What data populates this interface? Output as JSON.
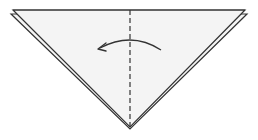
{
  "diagram": {
    "type": "origami-fold-step",
    "description": "Triangle (folded square) with vertical valley fold line; arrow indicates folding right half over to the left",
    "colors": {
      "paper_fill": "#f4f4f4",
      "outline": "#333333",
      "fold_line": "#333333",
      "arrow": "#333333",
      "background": "#ffffff"
    },
    "shapes": {
      "back_layer": [
        [
          11,
          14
        ],
        [
          247,
          14
        ],
        [
          130,
          129
        ]
      ],
      "front_layer": [
        [
          13,
          10
        ],
        [
          245,
          10
        ],
        [
          130,
          129
        ]
      ],
      "fold_line": {
        "x": 130,
        "y1": 10,
        "y2": 129,
        "style": "dashed"
      },
      "arrow": {
        "from": [
          161,
          50
        ],
        "to": [
          98,
          49
        ],
        "direction": "left",
        "curve_peak_y": 41
      }
    }
  }
}
